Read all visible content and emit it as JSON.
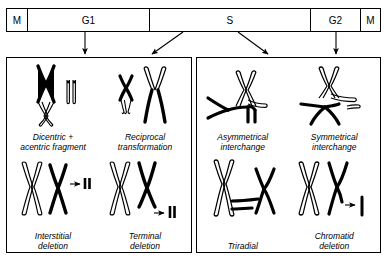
{
  "cell_cycle": {
    "phases": [
      {
        "label": "M",
        "name": "phase-m-first"
      },
      {
        "label": "G1",
        "name": "phase-g1"
      },
      {
        "label": "S",
        "name": "phase-s"
      },
      {
        "label": "G2",
        "name": "phase-g2"
      },
      {
        "label": "M",
        "name": "phase-m-last"
      }
    ]
  },
  "panels": [
    {
      "id": "chromosome-type-aberrations",
      "items": [
        {
          "id": "dicentric-acentric",
          "caption_line1": "Dicentric +",
          "caption_line2": "acentric fragment"
        },
        {
          "id": "reciprocal-transformation",
          "caption_line1": "Reciprocal",
          "caption_line2": "transformation"
        },
        {
          "id": "interstitial-deletion",
          "caption_line1": "Interstitial",
          "caption_line2": "deletion"
        },
        {
          "id": "terminal-deletion",
          "caption_line1": "Terminal",
          "caption_line2": "deletion"
        }
      ]
    },
    {
      "id": "chromatid-type-aberrations",
      "items": [
        {
          "id": "asymmetrical-interchange",
          "caption_line1": "Asymmetrical",
          "caption_line2": "interchange"
        },
        {
          "id": "symmetrical-interchange",
          "caption_line1": "Symmetrical",
          "caption_line2": "interchange"
        },
        {
          "id": "triradial",
          "caption_line1": "Triradial",
          "caption_line2": ""
        },
        {
          "id": "chromatid-deletion",
          "caption_line1": "Chromatid",
          "caption_line2": "deletion"
        }
      ]
    }
  ],
  "colors": {
    "ink": "#000000",
    "background": "#ffffff",
    "outline": "#1a1a1a"
  }
}
